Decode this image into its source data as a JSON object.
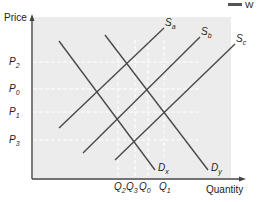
{
  "chart_data": {
    "type": "line",
    "title": "",
    "xlabel": "Quantity",
    "ylabel": "Price",
    "legend_fragment": "W",
    "grid": true,
    "price_levels": [
      {
        "label": "P",
        "sub": "2",
        "y": 62
      },
      {
        "label": "P",
        "sub": "0",
        "y": 89
      },
      {
        "label": "P",
        "sub": "1",
        "y": 112
      },
      {
        "label": "P",
        "sub": "3",
        "y": 140
      }
    ],
    "quantity_levels": [
      {
        "label": "Q",
        "sub": "2",
        "x": 118
      },
      {
        "label": "Q",
        "sub": "3",
        "x": 135
      },
      {
        "label": "Q",
        "sub": "0",
        "x": 148
      },
      {
        "label": "Q",
        "sub": "1",
        "x": 164
      }
    ],
    "series": [
      {
        "name": "Sa",
        "kind": "supply",
        "label": "S",
        "sub": "a",
        "points": [
          [
            59,
            128
          ],
          [
            164,
            28
          ]
        ]
      },
      {
        "name": "Sb",
        "kind": "supply",
        "label": "S",
        "sub": "b",
        "points": [
          [
            83,
            153
          ],
          [
            200,
            37
          ]
        ]
      },
      {
        "name": "Sc",
        "kind": "supply",
        "label": "S",
        "sub": "c",
        "points": [
          [
            115,
            160
          ],
          [
            235,
            44
          ]
        ]
      },
      {
        "name": "Dx",
        "kind": "demand",
        "label": "D",
        "sub": "x",
        "points": [
          [
            59,
            41
          ],
          [
            155,
            170
          ]
        ]
      },
      {
        "name": "Dy",
        "kind": "demand",
        "label": "D",
        "sub": "y",
        "points": [
          [
            105,
            35
          ],
          [
            208,
            170
          ]
        ]
      }
    ],
    "equilibria": [
      {
        "name": "Sa-Dx",
        "price": "P0",
        "quantity": "Q2"
      },
      {
        "name": "Sa-Dy",
        "price": "P2",
        "quantity": "Q0"
      },
      {
        "name": "Sb-Dx",
        "price": "P1",
        "quantity": "Q2"
      },
      {
        "name": "Sb-Dy",
        "price": "P1",
        "quantity": "Q1"
      },
      {
        "name": "Sc-Dx",
        "price": "P3",
        "quantity": "Q3"
      }
    ]
  },
  "colors": {
    "plot_bg": "#ececec",
    "line": "#4a4a4a",
    "axis": "#444444",
    "dash": "#ffffff"
  }
}
